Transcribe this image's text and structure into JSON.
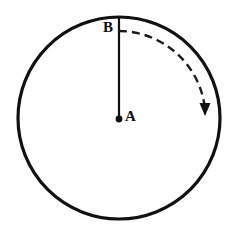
{
  "figure": {
    "type": "geometry-diagram",
    "canvas": {
      "width": 236,
      "height": 239,
      "background": "#ffffff"
    },
    "colors": {
      "stroke": "#111111",
      "dash": "#1a1a1a",
      "label": "#0d0d0d",
      "background": "#ffffff"
    },
    "circle": {
      "name": "main-circle",
      "center_x": 119,
      "center_y": 118,
      "radius": 101,
      "stroke_width": 3.2,
      "fill": "none"
    },
    "center_point": {
      "name": "center-point-A",
      "x": 119,
      "y": 119,
      "dot_radius": 3.4
    },
    "radius_line": {
      "name": "radius-segment-AB",
      "x1": 119,
      "y1": 119,
      "x2": 119,
      "y2": 17,
      "stroke_width": 2.2
    },
    "rotation_arc": {
      "name": "rotation-arc",
      "center_x": 119,
      "center_y": 118,
      "radius": 87,
      "start_angle_deg": 90,
      "end_angle_deg": 5,
      "dash_pattern": "8 5",
      "stroke_width": 2.4,
      "direction": "clockwise"
    },
    "arrow_head": {
      "name": "arrow-head",
      "tip_x": 205,
      "tip_y": 115,
      "width": 11,
      "height": 13,
      "points_to": "down"
    },
    "labels": [
      {
        "id": "B",
        "text": "B",
        "x": 103,
        "y": 20,
        "anchor": "point-on-circle-top"
      },
      {
        "id": "A",
        "text": "A",
        "x": 125,
        "y": 109,
        "anchor": "circle-center"
      }
    ]
  }
}
